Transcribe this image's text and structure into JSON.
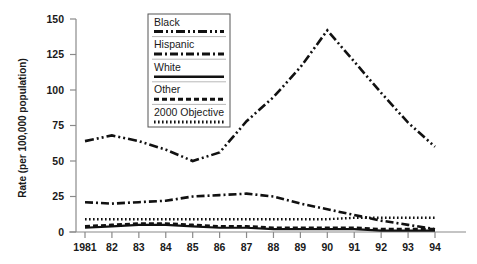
{
  "chart_data": {
    "type": "line",
    "title": "",
    "xlabel": "",
    "ylabel": "Rate (per 100,000 population)",
    "x": [
      "1981",
      "82",
      "83",
      "84",
      "85",
      "86",
      "87",
      "88",
      "89",
      "90",
      "91",
      "92",
      "93",
      "94"
    ],
    "xtick_labels": [
      "1981",
      "82",
      "83",
      "84",
      "85",
      "86",
      "87",
      "88",
      "89",
      "90",
      "91",
      "92",
      "93",
      "94"
    ],
    "ytick_labels": [
      "0",
      "25",
      "50",
      "75",
      "100",
      "125",
      "150"
    ],
    "yticks": [
      0,
      25,
      50,
      75,
      100,
      125,
      150
    ],
    "ylim": [
      0,
      150
    ],
    "grid": false,
    "legend_position": "upper-center",
    "series": [
      {
        "name": "Black",
        "dash_style": "dash-dot-dot",
        "color": "#111111",
        "values": [
          64,
          68,
          64,
          58,
          50,
          56,
          78,
          95,
          116,
          142,
          120,
          98,
          77,
          60
        ]
      },
      {
        "name": "Hispanic",
        "dash_style": "dash-dot",
        "color": "#111111",
        "values": [
          21,
          20,
          21,
          22,
          25,
          26,
          27,
          25,
          20,
          16,
          12,
          8,
          5,
          2
        ]
      },
      {
        "name": "White",
        "dash_style": "solid",
        "color": "#111111",
        "values": [
          3,
          4,
          5,
          5,
          4,
          3,
          3,
          2,
          2,
          2,
          2,
          1,
          1,
          1
        ]
      },
      {
        "name": "Other",
        "dash_style": "dashed",
        "color": "#111111",
        "values": [
          4,
          5,
          6,
          6,
          5,
          4,
          4,
          3,
          3,
          3,
          3,
          2,
          2,
          2
        ]
      },
      {
        "name": "2000 Objective",
        "dash_style": "dotted",
        "color": "#111111",
        "values": [
          9,
          9,
          9,
          9,
          9,
          9,
          9,
          9,
          9,
          9,
          10,
          10,
          10,
          10
        ]
      }
    ]
  },
  "legend": {
    "entries": [
      {
        "label": "Black",
        "dash_style": "dash-dot-dot"
      },
      {
        "label": "Hispanic",
        "dash_style": "dash-dot"
      },
      {
        "label": "White",
        "dash_style": "solid"
      },
      {
        "label": "Other",
        "dash_style": "dashed"
      },
      {
        "label": "2000 Objective",
        "dash_style": "dotted"
      }
    ]
  }
}
